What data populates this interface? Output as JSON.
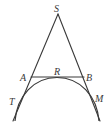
{
  "diagram": {
    "type": "geometry",
    "points": {
      "S": {
        "label": "S",
        "x": 58,
        "y": 14
      },
      "A": {
        "label": "A",
        "x": 31,
        "y": 77
      },
      "B": {
        "label": "B",
        "x": 84,
        "y": 77
      },
      "R": {
        "label": "R",
        "x": 58,
        "y": 77
      },
      "T": {
        "label": "T",
        "x": 19,
        "y": 98
      },
      "M": {
        "label": "M",
        "x": 93,
        "y": 96
      }
    },
    "labels": [
      "S",
      "A",
      "R",
      "B",
      "T",
      "M"
    ],
    "segments": [
      {
        "from": "S",
        "to": "T",
        "extended": true
      },
      {
        "from": "S",
        "to": "M",
        "extended": true
      },
      {
        "from": "A",
        "to": "B"
      }
    ],
    "arc": {
      "tangent_points": [
        "T",
        "R",
        "M"
      ]
    },
    "stroke_color": "#3a3a3a"
  }
}
